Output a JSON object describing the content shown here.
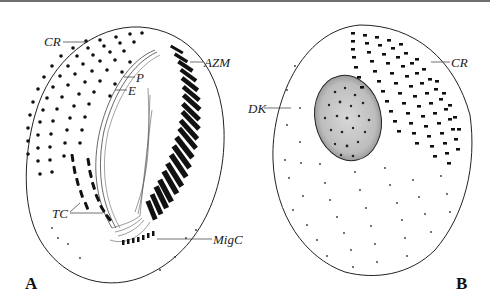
{
  "figure": {
    "top_rule_color": "#6e6e6e",
    "ink_color": "#111111",
    "panels": [
      {
        "id": "A",
        "panel_label": "A",
        "view": "ventral",
        "labels": {
          "cr": "CR",
          "azm": "AZM",
          "p": "P",
          "e": "E",
          "tc": "TC",
          "migc": "MigC"
        }
      },
      {
        "id": "B",
        "panel_label": "B",
        "view": "dorsal",
        "labels": {
          "cr": "CR",
          "dk": "DK"
        }
      }
    ],
    "legend_terms": [
      {
        "abbr": "CR",
        "meaning": "cirral rows"
      },
      {
        "abbr": "AZM",
        "meaning": "adoral zone of membranelles"
      },
      {
        "abbr": "P",
        "meaning": "paroral membrane"
      },
      {
        "abbr": "E",
        "meaning": "endoral membrane"
      },
      {
        "abbr": "TC",
        "meaning": "transverse cirri"
      },
      {
        "abbr": "MigC",
        "meaning": "migratory cirri"
      },
      {
        "abbr": "DK",
        "meaning": "dorsal kineties"
      }
    ]
  }
}
